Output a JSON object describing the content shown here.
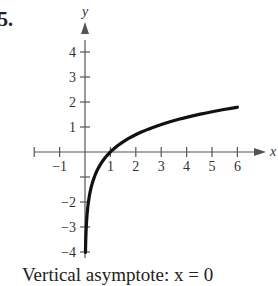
{
  "problem": {
    "number": "5."
  },
  "caption": "Vertical asymptote:  x = 0",
  "chart_data": {
    "type": "line",
    "title": "",
    "xlabel": "x",
    "ylabel": "y",
    "xlim": [
      -2,
      7
    ],
    "ylim": [
      -4.5,
      5
    ],
    "x_ticks": [
      -1,
      1,
      2,
      3,
      4,
      5,
      6
    ],
    "y_ticks": [
      -4,
      -3,
      -2,
      1,
      2,
      3,
      4
    ],
    "x_tick_labels": [
      "−1",
      "1",
      "2",
      "3",
      "4",
      "5",
      "6"
    ],
    "y_tick_labels": [
      "−4",
      "−3",
      "−2",
      "1",
      "2",
      "3",
      "4"
    ],
    "grid": false,
    "legend": null,
    "series": [
      {
        "name": "y = ln x",
        "x": [
          0.02,
          0.05,
          0.1,
          0.2,
          0.3,
          0.5,
          0.75,
          1,
          1.5,
          2,
          2.5,
          3,
          3.5,
          4,
          4.5,
          5,
          5.5,
          6
        ],
        "y": [
          -3.91,
          -3.0,
          -2.3,
          -1.61,
          -1.2,
          -0.69,
          -0.29,
          0,
          0.41,
          0.69,
          0.92,
          1.1,
          1.25,
          1.39,
          1.5,
          1.61,
          1.7,
          1.79
        ]
      }
    ],
    "annotations": [
      "Vertical asymptote: x = 0"
    ]
  }
}
